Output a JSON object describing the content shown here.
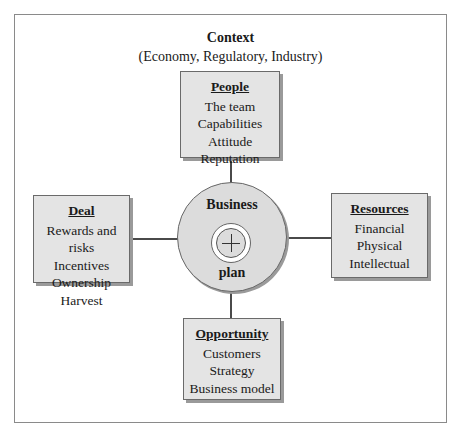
{
  "context": {
    "title": "Context",
    "subtitle": "(Economy, Regulatory, Industry)"
  },
  "center": {
    "top_label": "Business",
    "bottom_label": "plan",
    "symbol": "plus-icon"
  },
  "boxes": {
    "people": {
      "title": "People",
      "items": [
        "The team",
        "Capabilities",
        "Attitude",
        "Reputation"
      ]
    },
    "deal": {
      "title": "Deal",
      "items": [
        "Rewards and risks",
        "Incentives",
        "Ownership",
        "Harvest"
      ]
    },
    "resources": {
      "title": "Resources",
      "items": [
        "Financial",
        "Physical",
        "Intellectual"
      ]
    },
    "opportunity": {
      "title": "Opportunity",
      "items": [
        "Customers",
        "Strategy",
        "Business model"
      ]
    }
  },
  "colors": {
    "box_fill": "#e4e4e4",
    "circle_fill": "#dcdcdc",
    "line": "#4a4a4a",
    "frame": "#8a8a8a"
  }
}
